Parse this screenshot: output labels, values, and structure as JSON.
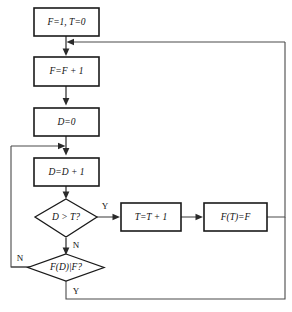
{
  "diagram": {
    "type": "flowchart",
    "background_color": "#ffffff",
    "line_color": "#4a4a4a",
    "box_border_color": "#1a1a1a"
  },
  "nodes": {
    "init": {
      "id": "init",
      "shape": "process",
      "text": "F=1,  T=0"
    },
    "increment_f": {
      "id": "increment_f",
      "shape": "process",
      "text": "F=F + 1"
    },
    "reset_d": {
      "id": "reset_d",
      "shape": "process",
      "text": "D=0"
    },
    "increment_d": {
      "id": "increment_d",
      "shape": "process",
      "text": "D=D + 1"
    },
    "compare_d_t": {
      "id": "compare_d_t",
      "shape": "decision",
      "text": "D > T?"
    },
    "divides_test": {
      "id": "divides_test",
      "shape": "decision",
      "text": "F(D)|F?"
    },
    "increment_t": {
      "id": "increment_t",
      "shape": "process",
      "text": "T=T + 1"
    },
    "store_f": {
      "id": "store_f",
      "shape": "process",
      "text": "F(T)=F"
    }
  },
  "branch_labels": {
    "compare_yes": "Y",
    "compare_no": "N",
    "divides_no": "N",
    "divides_yes": "Y"
  }
}
